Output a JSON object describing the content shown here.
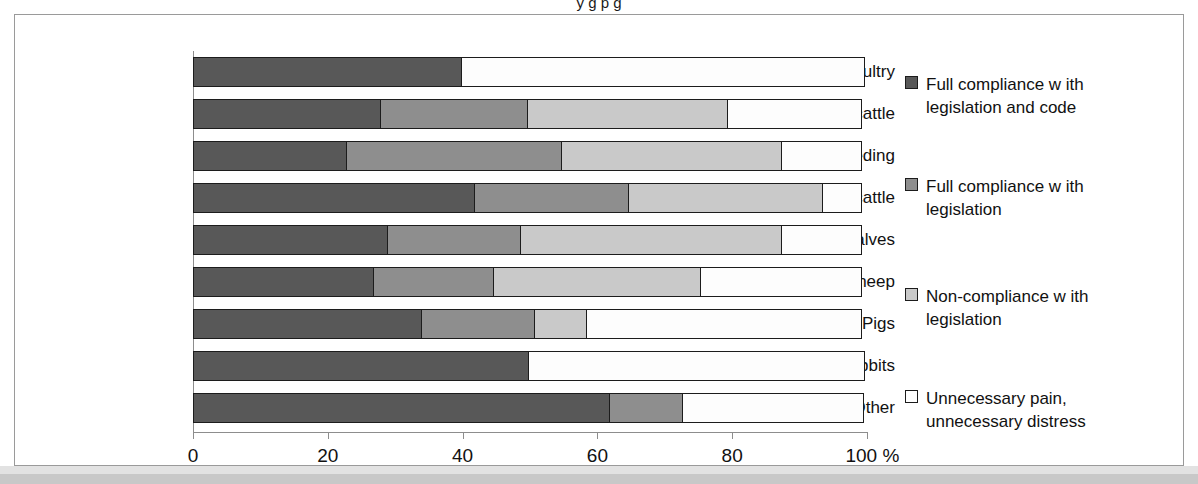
{
  "title_strip": "y                                                      g         p              g",
  "chart_data": {
    "type": "bar",
    "orientation": "horizontal",
    "stacked": true,
    "title": "",
    "xlabel": "",
    "ylabel": "",
    "xlim": [
      0,
      100
    ],
    "xticks": [
      0,
      20,
      40,
      60,
      80,
      100
    ],
    "xtick_labels": [
      "0",
      "20",
      "40",
      "60",
      "80",
      "100 %"
    ],
    "grid": false,
    "legend_position": "right",
    "categories": [
      "Poultry",
      "Dairy cattle",
      "Beef breeding",
      "Grow ing cattle",
      "Calves",
      "Sheep",
      "Pigs",
      "Rabbits",
      "Other"
    ],
    "series": [
      {
        "name": "Full compliance w ith legislation and code",
        "color": "#585858",
        "values": [
          40,
          28,
          23,
          42,
          29,
          27,
          34,
          50,
          62
        ]
      },
      {
        "name": "Full compliance w ith legislation",
        "color": "#8e8e8e",
        "values": [
          0,
          22,
          32,
          23,
          20,
          18,
          17,
          0,
          11
        ]
      },
      {
        "name": "Non-compliance w ith legislation",
        "color": "#c9c9c9",
        "values": [
          0,
          30,
          33,
          29,
          39,
          31,
          8,
          0,
          0
        ]
      },
      {
        "name": "Unnecessary pain, unnecessary distress",
        "color": "#ffffff",
        "values": [
          60,
          20,
          12,
          6,
          12,
          24,
          41,
          50,
          27
        ]
      }
    ]
  },
  "legend": {
    "items": [
      {
        "label_line1": "Full compliance w ith",
        "label_line2": "legislation and code",
        "swatch": "s0"
      },
      {
        "label_line1": "Full compliance w ith",
        "label_line2": "legislation",
        "swatch": "s1"
      },
      {
        "label_line1": "Non-compliance w ith",
        "label_line2": "legislation",
        "swatch": "s2"
      },
      {
        "label_line1": "Unnecessary pain,",
        "label_line2": "unnecessary distress",
        "swatch": "s3"
      }
    ]
  }
}
